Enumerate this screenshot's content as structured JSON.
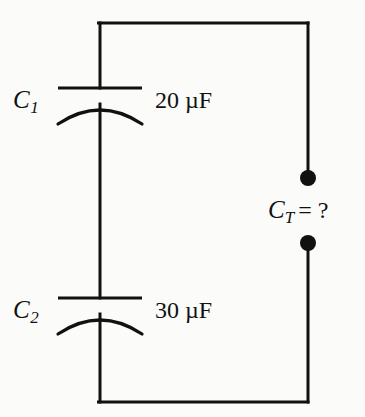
{
  "figure": {
    "kind": "circuit-diagram",
    "background_color": "#fbfbfa",
    "ink_color": "#111111"
  },
  "components": {
    "c1": {
      "designator": "C",
      "subscript": "1",
      "value": "20 µF",
      "symbol": "capacitor-polarized"
    },
    "c2": {
      "designator": "C",
      "subscript": "2",
      "value": "30 µF",
      "symbol": "capacitor-polarized"
    },
    "ct": {
      "designator": "C",
      "subscript": "T",
      "equals": "= ?",
      "symbol": "terminal-pair"
    }
  },
  "terminals": {
    "top_terminal_label": "top-terminal-dot",
    "bottom_terminal_label": "bottom-terminal-dot"
  }
}
